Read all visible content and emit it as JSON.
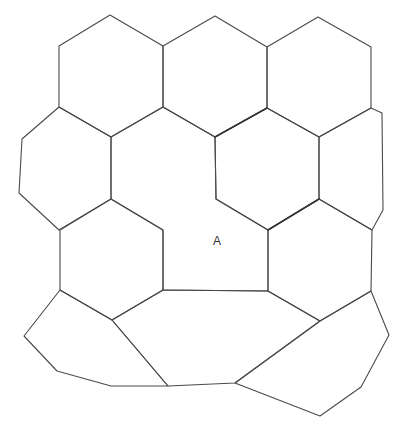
{
  "diagram": {
    "type": "cell-tessellation",
    "line_color": "#4a4a4a",
    "background": "#ffffff",
    "cell_count": 13,
    "labels": [
      {
        "id": "cell-a",
        "text": "A"
      }
    ]
  }
}
